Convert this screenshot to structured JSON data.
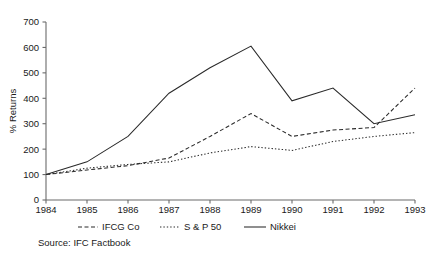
{
  "chart_data": {
    "type": "line",
    "title": "",
    "xlabel": "",
    "ylabel": "% Returns",
    "x": [
      1984,
      1985,
      1986,
      1987,
      1988,
      1989,
      1990,
      1991,
      1992,
      1993
    ],
    "categories": [
      "1984",
      "1985",
      "1986",
      "1987",
      "1988",
      "1989",
      "1990",
      "1991",
      "1992",
      "1993"
    ],
    "xlim": [
      1984,
      1993
    ],
    "ylim": [
      0,
      700
    ],
    "yticks": [
      0,
      100,
      200,
      300,
      400,
      500,
      600,
      700
    ],
    "ytick_labels": [
      "0",
      "100",
      "200",
      "300",
      "400",
      "500",
      "600",
      "700"
    ],
    "grid": false,
    "legend_position": "below-axes",
    "series": [
      {
        "name": "IFCG Co",
        "style": "dashed",
        "color": "#2a2a2a",
        "values": [
          100,
          118,
          135,
          165,
          250,
          340,
          250,
          275,
          285,
          440
        ]
      },
      {
        "name": "S & P 50",
        "style": "dotted",
        "color": "#2a2a2a",
        "values": [
          100,
          125,
          140,
          150,
          185,
          210,
          195,
          230,
          250,
          265
        ]
      },
      {
        "name": "Nikkei",
        "style": "solid",
        "color": "#2a2a2a",
        "values": [
          100,
          150,
          250,
          420,
          520,
          605,
          390,
          440,
          300,
          335
        ]
      }
    ],
    "annotations": [
      "Source: IFC Factbook"
    ]
  },
  "axis": {
    "y_title": "% Returns",
    "y_tick_labels": [
      "700",
      "600",
      "500",
      "400",
      "300",
      "200",
      "100",
      "0"
    ],
    "x_tick_labels": [
      "1984",
      "1985",
      "1986",
      "1987",
      "1988",
      "1989",
      "1990",
      "1991",
      "1992",
      "1993"
    ]
  },
  "legend": {
    "entries": [
      {
        "label": "IFCG Co",
        "style": "dashed"
      },
      {
        "label": "S & P 50",
        "style": "dotted"
      },
      {
        "label": "Nikkei",
        "style": "solid"
      }
    ]
  },
  "source": {
    "text": "Source: IFC Factbook"
  }
}
